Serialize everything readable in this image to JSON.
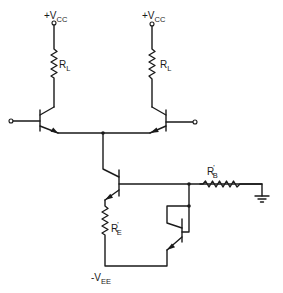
{
  "diagram": {
    "type": "circuit-schematic",
    "colors": {
      "ink": "#1a1a1a",
      "background": "#ffffff"
    },
    "labels": {
      "vcc_left": {
        "main": "+V",
        "sub": "CC"
      },
      "vcc_right": {
        "main": "+V",
        "sub": "CC"
      },
      "rl_left": {
        "main": "R",
        "sub": "L"
      },
      "rl_right": {
        "main": "R",
        "sub": "L"
      },
      "rb": {
        "main": "R",
        "prime": "'",
        "sub": "B"
      },
      "re": {
        "main": "R",
        "prime": "'",
        "sub": "E"
      },
      "vee": {
        "main": "-V",
        "sub": "EE"
      }
    },
    "components": [
      {
        "id": "Q1",
        "kind": "npn-transistor",
        "role": "left differential transistor"
      },
      {
        "id": "Q2",
        "kind": "npn-transistor",
        "role": "right differential transistor"
      },
      {
        "id": "Q3",
        "kind": "npn-transistor",
        "role": "tail current source"
      },
      {
        "id": "Q4",
        "kind": "npn-transistor",
        "role": "diode-connected bias transistor"
      },
      {
        "id": "RL1",
        "kind": "resistor",
        "label": "RL"
      },
      {
        "id": "RL2",
        "kind": "resistor",
        "label": "RL"
      },
      {
        "id": "RB",
        "kind": "resistor",
        "label": "R'B"
      },
      {
        "id": "RE",
        "kind": "resistor",
        "label": "R'E"
      },
      {
        "id": "GND",
        "kind": "ground"
      }
    ]
  }
}
